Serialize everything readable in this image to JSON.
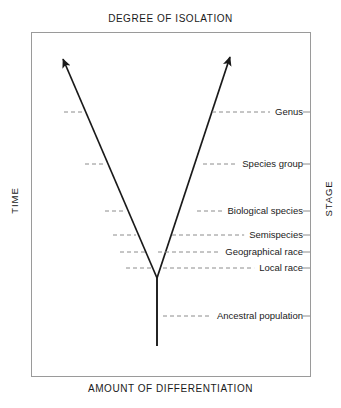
{
  "figure": {
    "top_axis_title": "DEGREE OF ISOLATION",
    "bottom_axis_title": "AMOUNT OF DIFFERENTIATION",
    "left_axis_title": "TIME",
    "right_axis_title": "STAGE",
    "line_color": "#1a1a1a",
    "dash_color": "#8c8c8c",
    "border_color": "#9a9a9a",
    "text_color": "#1a1a1a",
    "background": "#ffffff"
  },
  "stages": [
    {
      "label": "Genus",
      "y": 112,
      "label_right": 303,
      "dash_right_start": 212,
      "dash_left_start": 64,
      "dash_left_end": 83
    },
    {
      "label": "Species group",
      "y": 164,
      "label_right": 303,
      "dash_right_start": 203,
      "dash_left_start": 85,
      "dash_left_end": 104
    },
    {
      "label": "Biological species",
      "y": 211,
      "label_right": 303,
      "dash_right_start": 197,
      "dash_left_start": 105,
      "dash_left_end": 124
    },
    {
      "label": "Semispecies",
      "y": 235,
      "label_right": 303,
      "dash_right_start": 172,
      "dash_left_start": 113,
      "dash_left_end": 136
    },
    {
      "label": "Geographical race",
      "y": 252,
      "label_right": 303,
      "dash_right_start": 158,
      "dash_left_start": 120,
      "dash_left_end": 145
    },
    {
      "label": "Local race",
      "y": 268,
      "label_right": 303,
      "dash_right_start": 163,
      "dash_left_start": 126,
      "dash_left_end": 152
    },
    {
      "label": "Ancestral population",
      "y": 316,
      "label_right": 303,
      "dash_right_start": 163,
      "dash_left_start": 0,
      "dash_left_end": 0
    }
  ],
  "tree": {
    "vertex_x": 157,
    "vertex_y": 278,
    "stem_bottom_y": 346,
    "left_branch_tip_x": 63,
    "left_branch_tip_y": 59,
    "right_branch_tip_x": 230,
    "right_branch_tip_y": 57
  },
  "plot_area": {
    "left": 31,
    "top": 32,
    "width": 280,
    "height": 345
  }
}
